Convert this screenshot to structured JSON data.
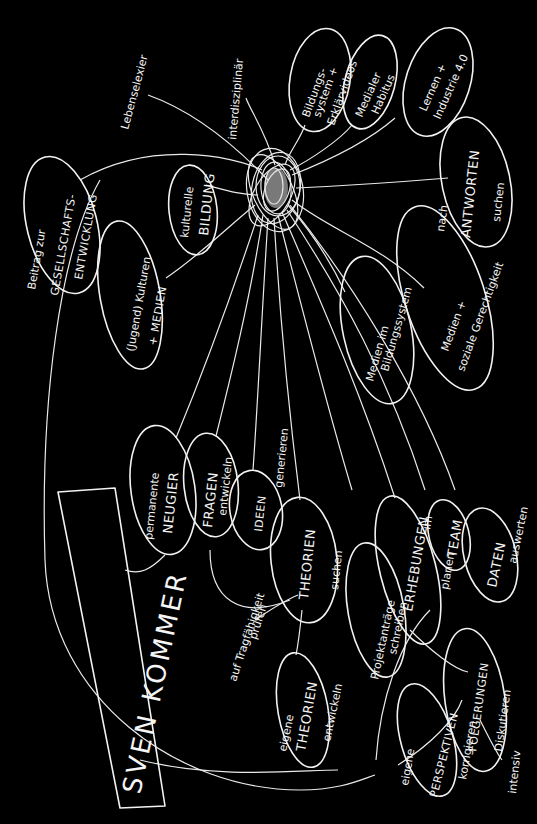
{
  "diagram": {
    "type": "hand-drawn mind map",
    "background": "#000000",
    "ink": "#f2f2f2",
    "orientation": "rotated 90deg counter-clockwise (text reads bottom-to-top)",
    "center_node": {
      "label": "SVEN KOMMER"
    },
    "hub": {
      "description": "dense scribbled tangle of loops"
    },
    "nodes": {
      "beitrag": {
        "line1": "Beitrag zur",
        "line2": "GESELLSCHAFTS-",
        "line3": "ENTWICKLUNG"
      },
      "lebenselexier": {
        "label": "Lebenselexier"
      },
      "interdisziplinaer": {
        "label": "interdisziplinär"
      },
      "bildungssystem": {
        "line1": "Bildungs-",
        "line2": "system +",
        "line3": "Erklärvideos"
      },
      "medialer": {
        "line1": "Medialer",
        "line2": "Habitus"
      },
      "lernen": {
        "line1": "Lernen +",
        "line2": "Industrie 4.0"
      },
      "antworten": {
        "prefix": "nach",
        "label": "ANTWORTEN",
        "suffix": "suchen"
      },
      "kulturelle": {
        "line1": "kulturelle",
        "line2": "BILDUNG"
      },
      "jugend": {
        "line1": "(Jugend) Kulturen",
        "line2": "+ MEDIEN"
      },
      "medien_bildung": {
        "line1": "Medien im",
        "line2": "Bildungssystem"
      },
      "medien_sozial": {
        "line1": "Medien +",
        "line2": "soziale Gerechtigkeit"
      },
      "neugier": {
        "line1": "permanente",
        "line2": "NEUGIER"
      },
      "fragen": {
        "label": "FRAGEN",
        "sub": "entwickeln"
      },
      "ideen": {
        "label": "IDEEN",
        "sub": "generieren"
      },
      "theorien": {
        "label": "THEORIEN",
        "sub": "suchen"
      },
      "tragfaehigkeit": {
        "line1": "auf Tragfähigkeit",
        "line2": "prüfen"
      },
      "eigene_theorien": {
        "pre": "eigene",
        "label": "THEORIEN",
        "sub": "entwickeln"
      },
      "projektantraege": {
        "line1": "Projektanträge",
        "line2": "schreiben"
      },
      "erhebungen": {
        "label": "ERHEBUNGEN",
        "sub": "planen"
      },
      "team": {
        "pre": "im",
        "label": "TEAM"
      },
      "daten": {
        "label": "DATEN",
        "sub": "auswerten"
      },
      "folgerungen": {
        "label": "FOLGERUNGEN",
        "sub": "Diskutieren"
      },
      "perspektiven": {
        "pre": "eigene",
        "label": "PERSPEKTIVEN",
        "sub": "korrigieren"
      },
      "intensiv": {
        "label": "intensiv"
      }
    }
  }
}
